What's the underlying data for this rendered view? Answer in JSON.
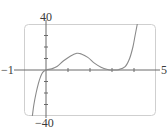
{
  "chart_data": {
    "type": "line",
    "title": "",
    "xlabel": "",
    "ylabel": "",
    "xlim": [
      -1,
      5
    ],
    "ylim": [
      -40,
      40
    ],
    "x_tick_labels": {
      "min": "−1",
      "max": "5"
    },
    "y_tick_labels": {
      "max": "40",
      "min": "−40"
    },
    "x_ticks": [
      1,
      2,
      3,
      4
    ],
    "y_ticks": [
      -30,
      -20,
      -10,
      10,
      20,
      30
    ],
    "grid": false,
    "legend": null,
    "series": [
      {
        "name": "f(x)",
        "x": [
          -0.62,
          -0.55,
          -0.45,
          -0.35,
          -0.25,
          -0.15,
          0,
          0.25,
          0.5,
          0.8,
          1.1,
          1.4,
          1.6,
          1.9,
          2.2,
          2.5,
          2.8,
          3.0,
          3.3,
          3.6,
          3.8,
          3.95,
          4.05,
          4.15
        ],
        "y": [
          -40,
          -30,
          -20,
          -12,
          -6,
          -2,
          0,
          1,
          3,
          8,
          12,
          14.5,
          14,
          11,
          6,
          2.5,
          0.5,
          0,
          0.3,
          3,
          10,
          20,
          30,
          40
        ]
      }
    ],
    "colors": {
      "curve": "#8a8a8a",
      "axes": "#6a6a6a",
      "frame": "#c8c8c8"
    }
  },
  "labels": {
    "y_max": "40",
    "y_min": "−40",
    "x_min": "−1",
    "x_max": "5"
  }
}
